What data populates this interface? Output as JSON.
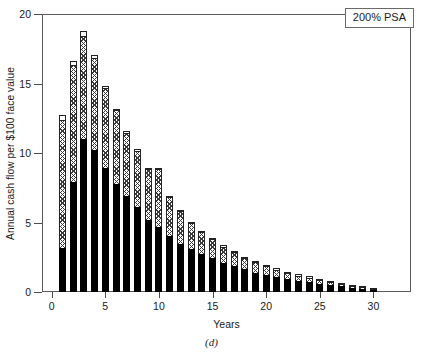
{
  "figure": {
    "caption": "(d)"
  },
  "legend": {
    "label": "200% PSA",
    "position": "top-right",
    "border_color": "#6a6a6a"
  },
  "colors": {
    "segment_bottom": "#000000",
    "segment_middle_hatch": "#3a3a3a",
    "segment_top": "#ffffff",
    "axis": "#4a4a4a",
    "frame": "#5a5a5a"
  },
  "chart_data": {
    "type": "bar",
    "stacked": true,
    "title": "",
    "subtitle": "",
    "xlabel": "Years",
    "ylabel": "Annual cash flow per $100 face value",
    "xlim": [
      -0.9,
      33.5
    ],
    "ylim": [
      0,
      20
    ],
    "yticks": [
      0,
      5,
      10,
      15,
      20
    ],
    "ytick_labels": [
      "0",
      "5",
      "10",
      "15",
      "20"
    ],
    "xticks": [
      0,
      5,
      10,
      15,
      20,
      25,
      30
    ],
    "xtick_labels": [
      "0",
      "5",
      "10",
      "15",
      "20",
      "25",
      "30"
    ],
    "grid": false,
    "legend_position": "upper right",
    "annotations": [
      "200% PSA"
    ],
    "categories": [
      1,
      2,
      3,
      4,
      5,
      6,
      7,
      8,
      9,
      10,
      11,
      12,
      13,
      14,
      15,
      16,
      17,
      18,
      19,
      20,
      21,
      22,
      23,
      24,
      25,
      26,
      27,
      28,
      29,
      30
    ],
    "series": [
      {
        "name": "Net interest",
        "pattern": "solid-black",
        "values": [
          3.2,
          7.9,
          11.0,
          10.2,
          8.9,
          7.8,
          6.9,
          6.1,
          5.2,
          4.65,
          4.0,
          3.5,
          3.1,
          2.75,
          2.45,
          2.15,
          1.9,
          1.68,
          1.45,
          1.3,
          1.15,
          1.0,
          0.88,
          0.78,
          0.68,
          0.6,
          0.52,
          0.44,
          0.36,
          0.28
        ]
      },
      {
        "name": "Scheduled principal + prepayments",
        "pattern": "hatched",
        "values": [
          9.1,
          8.35,
          7.35,
          6.55,
          5.7,
          5.2,
          4.5,
          4.0,
          3.55,
          4.1,
          2.75,
          2.3,
          1.85,
          1.55,
          1.35,
          1.1,
          0.95,
          0.75,
          0.7,
          0.6,
          0.5,
          0.4,
          0.35,
          0.3,
          0.22,
          0.15,
          0.1,
          0.06,
          0.04,
          0.02
        ]
      },
      {
        "name": "Residual",
        "pattern": "white",
        "values": [
          0.45,
          0.4,
          0.4,
          0.3,
          0.25,
          0.2,
          0.2,
          0.2,
          0.2,
          0.15,
          0.15,
          0.1,
          0.1,
          0.1,
          0.1,
          0.1,
          0.1,
          0.08,
          0.07,
          0.05,
          0.05,
          0.05,
          0.04,
          0.04,
          0.03,
          0.03,
          0.02,
          0.02,
          0.01,
          0.01
        ]
      }
    ],
    "totals": [
      12.75,
      16.65,
      18.75,
      17.05,
      14.85,
      13.2,
      11.6,
      10.3,
      8.95,
      8.9,
      6.9,
      5.9,
      5.05,
      4.4,
      3.9,
      3.35,
      2.95,
      2.51,
      2.22,
      1.95,
      1.7,
      1.45,
      1.27,
      1.12,
      0.93,
      0.78,
      0.64,
      0.52,
      0.41,
      0.31
    ]
  }
}
